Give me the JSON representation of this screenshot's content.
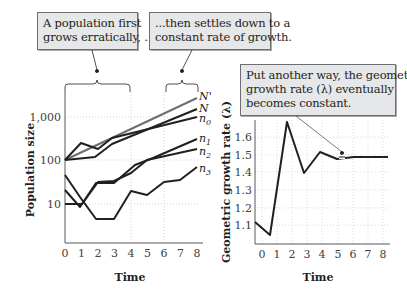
{
  "callouts": {
    "left": [
      "A population first",
      "grows erratically, ..."
    ],
    "middle": [
      "...then settles down to a",
      "constant rate of growth."
    ],
    "right": [
      "Put another way, the geometric",
      "growth rate (λ) eventually",
      "becomes constant."
    ]
  },
  "left_chart": {
    "ylabel": "Population size",
    "xlabel": "Time",
    "y_ticks": [
      "1,000",
      "100",
      "10"
    ],
    "x_ticks": [
      "0",
      "1",
      "2",
      "3",
      "4",
      "5",
      "6",
      "7",
      "8"
    ],
    "series_labels": [
      "N'",
      "N",
      "n0",
      "n1",
      "n2",
      "n3"
    ]
  },
  "right_chart": {
    "ylabel": "Geometric growth rate (λ)",
    "xlabel": "Time",
    "y_ticks": [
      "1.6",
      "1.5",
      "1.4",
      "1.3",
      "1.2",
      "1.1"
    ],
    "x_ticks": [
      "0",
      "1",
      "2",
      "3",
      "4",
      "5",
      "6",
      "7",
      "8"
    ]
  },
  "chart_data": [
    {
      "type": "line",
      "title": "",
      "xlabel": "Time",
      "ylabel": "Population size",
      "yscale": "log",
      "ylim": [
        3,
        3000
      ],
      "x": [
        0,
        1,
        2,
        3,
        4,
        5,
        6,
        7,
        8
      ],
      "series": [
        {
          "name": "N'",
          "values": [
            100,
            175,
            300,
            520,
            900,
            1550,
            2700,
            4600,
            8000
          ]
        },
        {
          "name": "N",
          "values": [
            100,
            115,
            200,
            340,
            580,
            1000,
            1700,
            2900,
            4600
          ]
        },
        {
          "name": "n0",
          "values": [
            100,
            110,
            115,
            200,
            340,
            580,
            1000,
            1700,
            2800
          ]
        },
        {
          "name": "n1",
          "values": [
            25,
            75,
            70,
            35,
            35,
            55,
            75,
            130,
            230
          ]
        },
        {
          "name": "n2",
          "values": [
            10,
            10,
            35,
            35,
            35,
            55,
            75,
            100,
            155
          ]
        },
        {
          "name": "n3",
          "values": [
            35,
            20,
            9,
            5,
            5,
            17,
            15,
            33,
            60
          ]
        }
      ],
      "annotations": [
        "A population first grows erratically, ...",
        "...then settles down to a constant rate of growth."
      ],
      "grid": "dotted vertical at t=4 and t=6 region",
      "legend": "inline labels at right end of lines"
    },
    {
      "type": "line",
      "title": "",
      "xlabel": "Time",
      "ylabel": "Geometric growth rate (λ)",
      "ylim": [
        1.0,
        1.7
      ],
      "x": [
        0,
        1,
        2,
        3,
        4,
        5,
        6,
        7,
        8
      ],
      "series": [
        {
          "name": "λ",
          "values": [
            1.12,
            1.05,
            1.68,
            1.4,
            1.52,
            1.48,
            1.49,
            1.49,
            1.49
          ]
        }
      ],
      "annotations": [
        "Put another way, the geometric growth rate (λ) eventually becomes constant."
      ],
      "grid": true
    }
  ]
}
